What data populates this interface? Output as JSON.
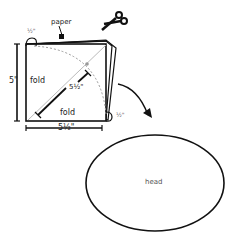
{
  "labels": {
    "paper": "paper",
    "half_top": "½\"",
    "half_right": "½\"",
    "height": "5\"",
    "fold_left": "fold",
    "fold_bottom": "fold",
    "diagonal": "5½\"",
    "width": "5½\"",
    "head": "head"
  },
  "icons": [
    "scissors-icon",
    "arrow-icon"
  ],
  "colors": {
    "stroke": "#111111",
    "dashed": "#999999",
    "text": "#222222"
  }
}
